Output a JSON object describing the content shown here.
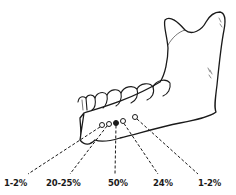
{
  "diagram": {
    "foramina": [
      {
        "id": "f1",
        "filled": false
      },
      {
        "id": "f2",
        "filled": false
      },
      {
        "id": "f3",
        "filled": true
      },
      {
        "id": "f4",
        "filled": false
      },
      {
        "id": "f5",
        "filled": false
      }
    ],
    "labels": [
      {
        "text": "1-2%"
      },
      {
        "text": "20-25%"
      },
      {
        "text": "50%"
      },
      {
        "text": "24%"
      },
      {
        "text": "1-2%"
      }
    ],
    "colors": {
      "line": "#1a1a1a",
      "background": "#ffffff"
    }
  }
}
